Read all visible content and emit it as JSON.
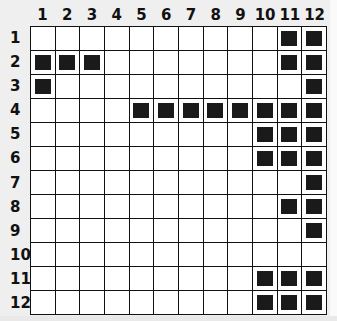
{
  "puzzle": {
    "rows": 12,
    "cols": 12,
    "col_labels": [
      "1",
      "2",
      "3",
      "4",
      "5",
      "6",
      "7",
      "8",
      "9",
      "10",
      "11",
      "12"
    ],
    "row_labels": [
      "1",
      "2",
      "3",
      "4",
      "5",
      "6",
      "7",
      "8",
      "9",
      "10",
      "11",
      "12"
    ],
    "filled": {
      "1": [
        11,
        12
      ],
      "2": [
        1,
        2,
        3,
        11,
        12
      ],
      "3": [
        1,
        12
      ],
      "4": [
        5,
        6,
        7,
        8,
        9,
        10,
        11,
        12
      ],
      "5": [
        10,
        11,
        12
      ],
      "6": [
        10,
        11,
        12
      ],
      "7": [
        12
      ],
      "8": [
        11,
        12
      ],
      "9": [
        12
      ],
      "10": [],
      "11": [
        10,
        11,
        12
      ],
      "12": [
        10,
        11,
        12
      ]
    },
    "colors": {
      "filled": "#1a1a1a",
      "empty": "#ffffff",
      "grid_line": "#111111",
      "background": "#efefef"
    }
  }
}
